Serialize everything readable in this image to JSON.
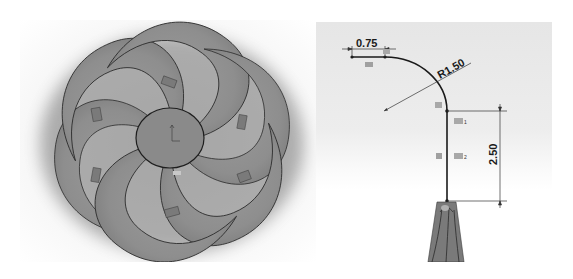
{
  "figure": {
    "left_view": {
      "title": "impeller-top-view",
      "blade_count": 6,
      "colors": {
        "blade": "#8c8c8c",
        "blade_highlight": "#9a9a9a",
        "edge": "#2a2a2a",
        "shadow": "#6a6a6a",
        "hub": "#8a8a8a"
      }
    },
    "right_view": {
      "dimensions": {
        "horizontal": "0.75",
        "radius": "R1.50",
        "vertical": "2.50"
      },
      "relations": {
        "r1_subscript": "1",
        "r2_subscript": "2"
      },
      "colors": {
        "sketch_line": "#1a1a1a",
        "dim_line": "#333333",
        "relation_icon": "#9c9c9c",
        "blade": "#7a7a7a"
      }
    }
  }
}
